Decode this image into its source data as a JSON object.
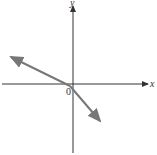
{
  "diagram": {
    "type": "coordinate-plane",
    "x_axis_label": "x",
    "y_axis_label": "y",
    "origin_label": "0",
    "line": {
      "description": "Line with negative slope, x-intercept negative, y-intercept negative",
      "slope_sign": "negative",
      "x_intercept_sign": "negative",
      "y_intercept_sign": "negative",
      "color": "#777777"
    },
    "axis_color": "#333333"
  }
}
